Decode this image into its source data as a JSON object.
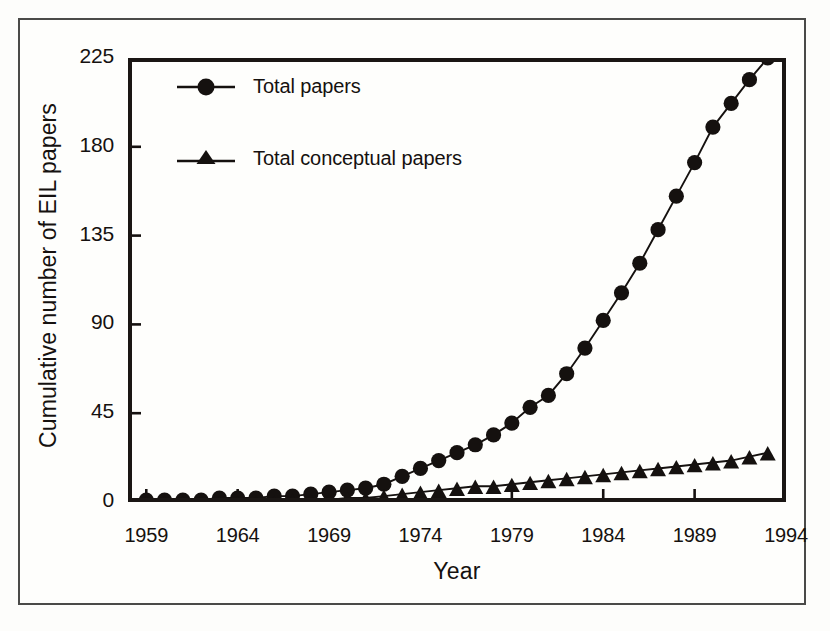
{
  "figure": {
    "background_color": "#fdfdfb",
    "ink_color": "#15110f",
    "has_outer_frame": true
  },
  "axes": {
    "xlabel": "Year",
    "ylabel": "Cumulative number of EIL papers",
    "xtick_labels": [
      "1959",
      "1964",
      "1969",
      "1974",
      "1979",
      "1984",
      "1989",
      "1994"
    ],
    "ytick_labels": [
      "0",
      "45",
      "90",
      "135",
      "180",
      "225"
    ]
  },
  "legend": {
    "entries": [
      {
        "label": "Total papers",
        "marker": "circle"
      },
      {
        "label": "Total conceptual papers",
        "marker": "triangle"
      }
    ]
  },
  "chart_data": {
    "type": "line",
    "title": "",
    "xlabel": "Year",
    "ylabel": "Cumulative number of EIL papers",
    "xlim": [
      1958,
      1994
    ],
    "ylim": [
      0,
      225
    ],
    "xticks": [
      1959,
      1964,
      1969,
      1974,
      1979,
      1984,
      1989,
      1994
    ],
    "yticks": [
      0,
      45,
      90,
      135,
      180,
      225
    ],
    "grid": false,
    "legend_position": "upper-left-inside",
    "x": [
      1959,
      1960,
      1961,
      1962,
      1963,
      1964,
      1965,
      1966,
      1967,
      1968,
      1969,
      1970,
      1971,
      1972,
      1973,
      1974,
      1975,
      1976,
      1977,
      1978,
      1979,
      1980,
      1981,
      1982,
      1983,
      1984,
      1985,
      1986,
      1987,
      1988,
      1989,
      1990,
      1991,
      1992,
      1993
    ],
    "series": [
      {
        "name": "Total papers",
        "marker": "circle",
        "color": "#15110f",
        "values": [
          1,
          1,
          1,
          1,
          2,
          2,
          2,
          3,
          3,
          4,
          5,
          6,
          7,
          9,
          13,
          17,
          21,
          25,
          29,
          34,
          40,
          48,
          54,
          65,
          78,
          92,
          106,
          121,
          138,
          155,
          172,
          190,
          202,
          214,
          225
        ]
      },
      {
        "name": "Total conceptual papers",
        "marker": "triangle",
        "color": "#15110f",
        "values": [
          0,
          0,
          0,
          0,
          0,
          0,
          0,
          0,
          1,
          1,
          1,
          2,
          2,
          3,
          4,
          5,
          6,
          7,
          8,
          8,
          9,
          10,
          11,
          12,
          13,
          14,
          15,
          16,
          17,
          18,
          19,
          20,
          21,
          23,
          25
        ]
      }
    ]
  }
}
